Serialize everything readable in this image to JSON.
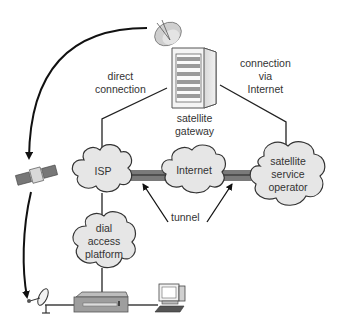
{
  "diagram": {
    "type": "network-topology",
    "nodes": {
      "satellite_gateway": {
        "label_line1": "satellite",
        "label_line2": "gateway",
        "icon": "server-tower-with-dish"
      },
      "isp": {
        "label": "ISP",
        "icon": "cloud"
      },
      "internet": {
        "label": "Internet",
        "icon": "cloud"
      },
      "satellite_service_operator": {
        "label_line1": "satellite",
        "label_line2": "service",
        "label_line3": "operator",
        "icon": "cloud"
      },
      "dial_access_platform": {
        "label_line1": "dial",
        "label_line2": "access",
        "label_line3": "platform",
        "icon": "cloud"
      },
      "satellite": {
        "icon": "satellite"
      },
      "receiver_dish": {
        "icon": "satellite-dish"
      },
      "set_top_box": {
        "icon": "modem-box"
      },
      "computer": {
        "icon": "desktop-computer"
      }
    },
    "edge_labels": {
      "direct_connection": {
        "line1": "direct",
        "line2": "connection"
      },
      "connection_via_internet": {
        "line1": "connection",
        "line2": "via",
        "line3": "Internet"
      },
      "tunnel": "tunnel"
    },
    "colors": {
      "line": "#222222",
      "cloud_fill": "#e6e6e6",
      "cloud_stroke": "#333333",
      "tunnel_band": "#7a7a7a",
      "text": "#333333"
    }
  }
}
